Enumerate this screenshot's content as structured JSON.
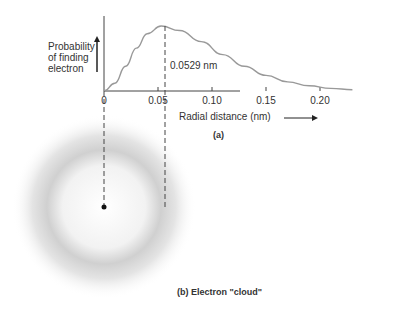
{
  "chart_data": {
    "type": "line",
    "title": "",
    "xlabel": "Radial distance (nm)",
    "ylabel": "Probability of finding electron",
    "ylabel_lines": [
      "Probability",
      "of finding",
      "electron"
    ],
    "x_ticks": [
      "0",
      "0.05",
      "0.10",
      "0.15",
      "0.20"
    ],
    "xlim": [
      0,
      0.23
    ],
    "series": [
      {
        "name": "radial probability",
        "x": [
          0,
          0.01,
          0.02,
          0.03,
          0.04,
          0.0529,
          0.07,
          0.09,
          0.11,
          0.13,
          0.15,
          0.17,
          0.19,
          0.21,
          0.23
        ],
        "values": [
          0,
          0.12,
          0.38,
          0.66,
          0.88,
          1.0,
          0.93,
          0.76,
          0.56,
          0.38,
          0.24,
          0.14,
          0.08,
          0.04,
          0.02
        ]
      }
    ],
    "annotation": {
      "x": 0.0529,
      "label": "0.0529 nm"
    },
    "grid": false
  },
  "captions": {
    "part_a": "(a)",
    "part_b": "(b)  Electron \"cloud\""
  }
}
